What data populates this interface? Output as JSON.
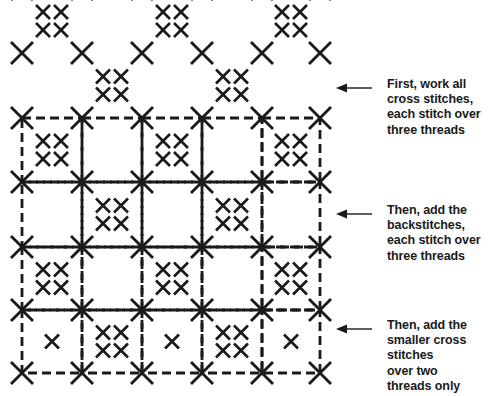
{
  "figure": {
    "background_color": "#ffffff",
    "ink_color": "#1a1a1a"
  },
  "annotations": [
    {
      "id": "annotation-1",
      "arrow_name": "callout-arrow-cross-stitches",
      "text": "First, work all\ncross stitches,\neach stitch over\nthree threads",
      "arrow": {
        "x1": 372,
        "y1": 88,
        "x2": 336,
        "y2": 88
      }
    },
    {
      "id": "annotation-2",
      "arrow_name": "callout-arrow-backstitches",
      "text": "Then, add the\nbackstitches,\neach stitch over\nthree threads",
      "arrow": {
        "x1": 372,
        "y1": 214,
        "x2": 336,
        "y2": 214
      }
    },
    {
      "id": "annotation-3",
      "arrow_name": "callout-arrow-smaller-cross-stitches",
      "text": "Then, add the\nsmaller cross stitches\nover two\nthreads only",
      "arrow": {
        "x1": 372,
        "y1": 329,
        "x2": 336,
        "y2": 329
      }
    }
  ],
  "grid": {
    "origin_x": 22,
    "origin_y": 53,
    "cell_width": 60,
    "cell_height": 64,
    "columns": 6,
    "rows": 6,
    "lattice_rows_y": [
      -11,
      53,
      118,
      182,
      247,
      310,
      373
    ],
    "lattice_cols_x": [
      22,
      82,
      142,
      202,
      262,
      320
    ]
  },
  "legend_values": {
    "large_cross_arm": 11,
    "large_cross_stroke": 2.9,
    "small_cross_arm": 7,
    "small_cross_stroke": 2.6,
    "cluster_offset": 9,
    "backstitch_stroke": 2.8,
    "backstitch_dash": "9 5"
  },
  "chart_data": {
    "type": "diagram",
    "bands": [
      {
        "name": "band-cross-stitches-only",
        "label": "First, work all cross stitches, each stitch over three threads",
        "row_range": [
          0,
          2
        ],
        "contains": [
          "large-cross-lattice",
          "small-cross-clusters"
        ]
      },
      {
        "name": "band-with-backstitches",
        "label": "Then, add the backstitches, each stitch over three threads",
        "row_range": [
          2,
          4
        ],
        "contains": [
          "large-cross-lattice",
          "small-cross-clusters",
          "dashed-backstitch-squares"
        ]
      },
      {
        "name": "band-with-smaller-cross-stitches",
        "label": "Then, add the smaller cross stitches over two threads only",
        "row_range": [
          4,
          5
        ],
        "contains": [
          "large-cross-lattice",
          "small-cross-clusters",
          "dashed-backstitch-squares",
          "single-small-cross-in-empty-square"
        ]
      }
    ],
    "cell_pattern": "checkerboard: cells where (row+col) is even hold a 2x2 cluster of small crosses; cells where (row+col) is odd are left plain and, in the lowest band, receive one small cross in the centre"
  }
}
